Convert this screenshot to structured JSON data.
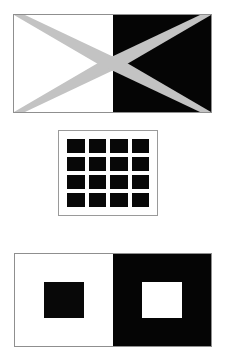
{
  "page": {
    "background_color": "#ffffff",
    "width": 227,
    "height": 364,
    "figure_count": 3
  },
  "colors": {
    "white": "#ffffff",
    "black": "#050505",
    "gray_band": "#c3c3c3",
    "border_gray": "#8f8f8f"
  },
  "figures": {
    "bowtie": {
      "name": "bowtie-bands-figure",
      "caption": "Gray bands forming an X across white and black halves",
      "x": 13,
      "y": 14,
      "width": 199,
      "height": 99,
      "left_half_color": "#ffffff",
      "right_half_color": "#050505",
      "band_color": "#c3c3c3",
      "band_count": 4,
      "band_thickness": 11
    },
    "grid": {
      "name": "hermann-grid-figure",
      "caption": "Four by four array of black squares on white",
      "x": 58,
      "y": 130,
      "width": 100,
      "height": 86,
      "rows": 4,
      "columns": 4,
      "cell_count": 16,
      "cell_color": "#080808",
      "gap_color": "#ffffff"
    },
    "contrast": {
      "name": "simultaneous-contrast-figure",
      "caption": "Black square on white field beside white square on black field",
      "x": 14,
      "y": 253,
      "width": 198,
      "height": 94,
      "left_pane_color": "#ffffff",
      "right_pane_color": "#050505",
      "left_square_color": "#080808",
      "right_square_color": "#ffffff",
      "square_width": 40,
      "square_height": 36
    }
  },
  "grid_cells": [
    {
      "row": 1,
      "col": 1
    },
    {
      "row": 1,
      "col": 2
    },
    {
      "row": 1,
      "col": 3
    },
    {
      "row": 1,
      "col": 4
    },
    {
      "row": 2,
      "col": 1
    },
    {
      "row": 2,
      "col": 2
    },
    {
      "row": 2,
      "col": 3
    },
    {
      "row": 2,
      "col": 4
    },
    {
      "row": 3,
      "col": 1
    },
    {
      "row": 3,
      "col": 2
    },
    {
      "row": 3,
      "col": 3
    },
    {
      "row": 3,
      "col": 4
    },
    {
      "row": 4,
      "col": 1
    },
    {
      "row": 4,
      "col": 2
    },
    {
      "row": 4,
      "col": 3
    },
    {
      "row": 4,
      "col": 4
    }
  ]
}
